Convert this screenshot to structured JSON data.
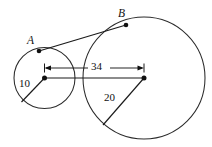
{
  "figure": {
    "type": "geometry-diagram",
    "canvas": {
      "width": 212,
      "height": 147,
      "background": "#ffffff"
    },
    "ink_color": "#1a1a1a",
    "shapes": {
      "small_circle": {
        "cx": 44.5,
        "cy": 78,
        "r": 30.5,
        "radius_label": "10"
      },
      "large_circle": {
        "cx": 144,
        "cy": 78,
        "r": 61,
        "radius_label": "20"
      }
    },
    "points": [
      {
        "id": "A",
        "label": "A",
        "x": 39,
        "y": 51,
        "label_x": 27,
        "label_y": 36
      },
      {
        "id": "B",
        "label": "B",
        "x": 126,
        "y": 25,
        "label_x": 118,
        "label_y": 9
      },
      {
        "id": "O1",
        "label": "",
        "x": 44.5,
        "y": 78
      },
      {
        "id": "O2",
        "label": "",
        "x": 144,
        "y": 78
      }
    ],
    "segments": {
      "tangent": {
        "from": "A",
        "to": "B"
      },
      "center_line": {
        "from": "O1",
        "to": "O2"
      },
      "small_radius": {
        "x1": 44.5,
        "y1": 78,
        "x2": 21.5,
        "y2": 102
      },
      "large_radius": {
        "x1": 144,
        "y1": 78,
        "x2": 103,
        "y2": 125
      }
    },
    "dimension": {
      "value_label": "34",
      "x1": 44.5,
      "x2": 144,
      "y": 68,
      "label_x": 88,
      "label_y": 60
    },
    "labels": {
      "small_radius_label": {
        "text": "10",
        "x": 19,
        "y": 77
      },
      "large_radius_label": {
        "text": "20",
        "x": 104,
        "y": 91
      },
      "distance_label": {
        "text": "34"
      },
      "point_a_label": {
        "text": "A"
      },
      "point_b_label": {
        "text": "B"
      }
    }
  }
}
